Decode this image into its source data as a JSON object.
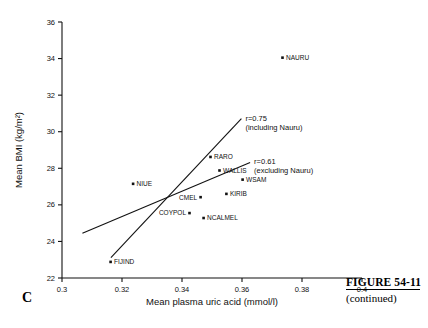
{
  "figure": {
    "panel_letter": "C",
    "caption_title": "FIGURE 54-11",
    "caption_sub": "(continued)"
  },
  "chart_data": {
    "type": "scatter",
    "title": "",
    "xlabel": "Mean plasma uric acid (mmol/l)",
    "ylabel": "Mean BMI (kg/m²)",
    "xlim": [
      0.3,
      0.4
    ],
    "ylim": [
      22,
      36
    ],
    "xticks": [
      0.3,
      0.32,
      0.34,
      0.36,
      0.38,
      0.4
    ],
    "xticklabels": [
      "0.3",
      "0.32",
      "0.34",
      "0.36",
      "0.38",
      "0.4"
    ],
    "yticks": [
      22,
      24,
      26,
      28,
      30,
      32,
      34,
      36
    ],
    "yticklabels": [
      "22",
      "24",
      "26",
      "28",
      "30",
      "32",
      "34",
      "36"
    ],
    "grid": false,
    "legend": "none",
    "points": [
      {
        "label": "NAURU",
        "x": 0.3735,
        "y": 34.05,
        "label_pos": "right"
      },
      {
        "label": "RARO",
        "x": 0.3495,
        "y": 28.62,
        "label_pos": "right"
      },
      {
        "label": "WALLIS",
        "x": 0.3525,
        "y": 27.88,
        "label_pos": "right"
      },
      {
        "label": "WSAM",
        "x": 0.3602,
        "y": 27.38,
        "label_pos": "right"
      },
      {
        "label": "NIUE",
        "x": 0.3237,
        "y": 27.15,
        "label_pos": "right"
      },
      {
        "label": "KIRIB",
        "x": 0.3548,
        "y": 26.6,
        "label_pos": "right"
      },
      {
        "label": "CMEL",
        "x": 0.3462,
        "y": 26.42,
        "label_pos": "left"
      },
      {
        "label": "COYPOL",
        "x": 0.3425,
        "y": 25.55,
        "label_pos": "left"
      },
      {
        "label": "NCALMEL",
        "x": 0.3472,
        "y": 25.28,
        "label_pos": "right"
      },
      {
        "label": "FIJIND",
        "x": 0.3162,
        "y": 22.88,
        "label_pos": "right"
      }
    ],
    "lines": [
      {
        "name": "including-nauru",
        "annotation_r": "r=0.75",
        "annotation_note": "(including Nauru)",
        "x_start": 0.3163,
        "y_start": 23.12,
        "x_end": 0.3598,
        "y_end": 30.72
      },
      {
        "name": "excluding-nauru",
        "annotation_r": "r=0.61",
        "annotation_note": "(excluding Nauru)",
        "x_start": 0.3068,
        "y_start": 24.45,
        "x_end": 0.3627,
        "y_end": 28.32
      }
    ]
  }
}
